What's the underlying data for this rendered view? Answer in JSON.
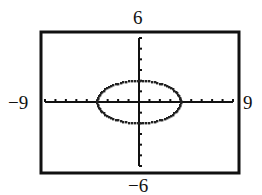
{
  "chart_data": {
    "type": "line",
    "title": "",
    "xlabel": "",
    "ylabel": "",
    "xlim": [
      -9,
      9
    ],
    "ylim": [
      -6,
      6
    ],
    "xscale_ticks": 1,
    "yscale_ticks": 1,
    "grid": false,
    "legend": null,
    "window_labels": {
      "xmin": "−9",
      "xmax": "9",
      "ymin": "−6",
      "ymax": "6"
    },
    "series": [
      {
        "name": "ellipse",
        "equation": "x^2/16 + y^2/4 = 1",
        "center": [
          0,
          0
        ],
        "semi_axis_x": 4,
        "semi_axis_y": 2,
        "style": "dotted pixelated curve (graphing calculator)",
        "key_points": [
          [
            -4,
            0
          ],
          [
            4,
            0
          ],
          [
            0,
            2
          ],
          [
            0,
            -2
          ]
        ]
      }
    ]
  },
  "colors": {
    "ink": "#111111",
    "background": "#ffffff"
  }
}
